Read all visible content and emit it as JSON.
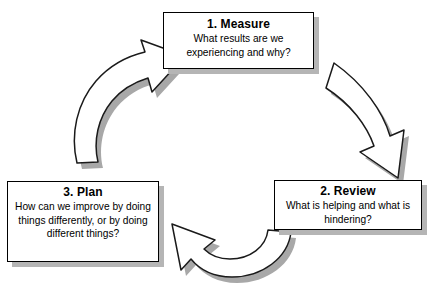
{
  "diagram": {
    "type": "cycle-diagram",
    "background_color": "#ffffff",
    "box_border_color": "#000000",
    "box_fill_color": "#ffffff",
    "shadow_color": "#b5b5b5",
    "arrow_fill_color": "#ffffff",
    "arrow_outline_color": "#1a1a1a",
    "arrow_shadow_color": "#a8a8a8",
    "stages": [
      {
        "id": "measure",
        "title": "1. Measure",
        "description": "What results are we experiencing and why?",
        "desc_line_1": "What results are we",
        "desc_line_2": "experiencing and why?"
      },
      {
        "id": "review",
        "title": "2. Review",
        "description": "What is helping and what is hindering?",
        "desc_line_1": "What is helping and what is",
        "desc_line_2": "hindering?"
      },
      {
        "id": "plan",
        "title": "3. Plan",
        "description": "How can we improve by doing things differently, or by doing different things?",
        "desc_line_1": "How can we improve by doing",
        "desc_line_2": "things differently, or by doing",
        "desc_line_3": "different things?"
      }
    ],
    "arrows": [
      {
        "id": "measure-to-review",
        "from": "measure",
        "to": "review",
        "direction": "clockwise-down-right"
      },
      {
        "id": "review-to-plan",
        "from": "review",
        "to": "plan",
        "direction": "clockwise-left"
      },
      {
        "id": "plan-to-measure",
        "from": "plan",
        "to": "measure",
        "direction": "clockwise-up-right"
      }
    ]
  }
}
